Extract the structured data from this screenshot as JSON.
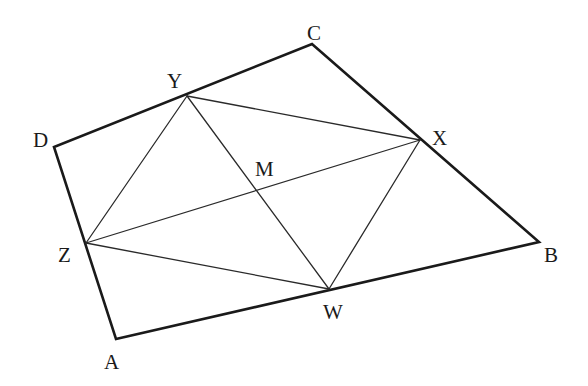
{
  "diagram": {
    "type": "geometry-figure",
    "colors": {
      "line": "#1a1a1a",
      "background": "#ffffff"
    },
    "points": {
      "A": {
        "label": "A",
        "x": 116,
        "y": 339,
        "label_x": 104,
        "label_y": 369
      },
      "B": {
        "label": "B",
        "x": 539,
        "y": 242,
        "label_x": 544,
        "label_y": 262
      },
      "C": {
        "label": "C",
        "x": 312,
        "y": 44,
        "label_x": 307,
        "label_y": 40
      },
      "D": {
        "label": "D",
        "x": 54,
        "y": 147,
        "label_x": 33,
        "label_y": 147
      },
      "W": {
        "label": "W",
        "x": 329,
        "y": 289,
        "label_x": 323,
        "label_y": 319
      },
      "X": {
        "label": "X",
        "x": 420,
        "y": 140,
        "label_x": 432,
        "label_y": 145
      },
      "Y": {
        "label": "Y",
        "x": 187,
        "y": 96,
        "label_x": 167,
        "label_y": 88
      },
      "Z": {
        "label": "Z",
        "x": 86,
        "y": 243,
        "label_x": 58,
        "label_y": 262
      },
      "M": {
        "label": "M",
        "x": 258,
        "y": 191,
        "label_x": 255,
        "label_y": 176
      }
    },
    "outer_quadrilateral": [
      "A",
      "B",
      "C",
      "D"
    ],
    "inner_segments": [
      [
        "Y",
        "X"
      ],
      [
        "X",
        "W"
      ],
      [
        "W",
        "Z"
      ],
      [
        "Z",
        "Y"
      ],
      [
        "Z",
        "X"
      ],
      [
        "Y",
        "W"
      ]
    ]
  }
}
